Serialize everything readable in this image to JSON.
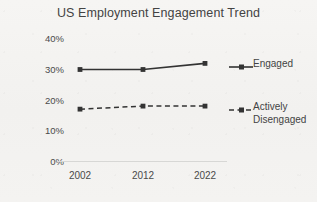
{
  "chart_data": {
    "type": "line",
    "title": "US Employment Engagement Trend",
    "xlabel": "",
    "ylabel": "",
    "categories": [
      "2002",
      "2012",
      "2022"
    ],
    "x": [
      2002,
      2012,
      2022
    ],
    "series": [
      {
        "name": "Engaged",
        "values": [
          30,
          30,
          32
        ],
        "style": "solid",
        "color": "#333333",
        "marker": "square"
      },
      {
        "name": "Actively Disengaged",
        "values": [
          17,
          18,
          18
        ],
        "style": "dashed",
        "color": "#333333",
        "marker": "square"
      }
    ],
    "ylim": [
      0,
      40
    ],
    "ytick_labels": [
      "40%",
      "30%",
      "20%",
      "10%",
      "0%"
    ],
    "ytick_values": [
      40,
      30,
      20,
      10,
      0
    ],
    "grid": false,
    "legend_position": "right",
    "legend_entries": [
      "Engaged",
      "Actively\nDisengaged"
    ]
  },
  "axis": {
    "baseline_color": "#d7d7d5"
  }
}
